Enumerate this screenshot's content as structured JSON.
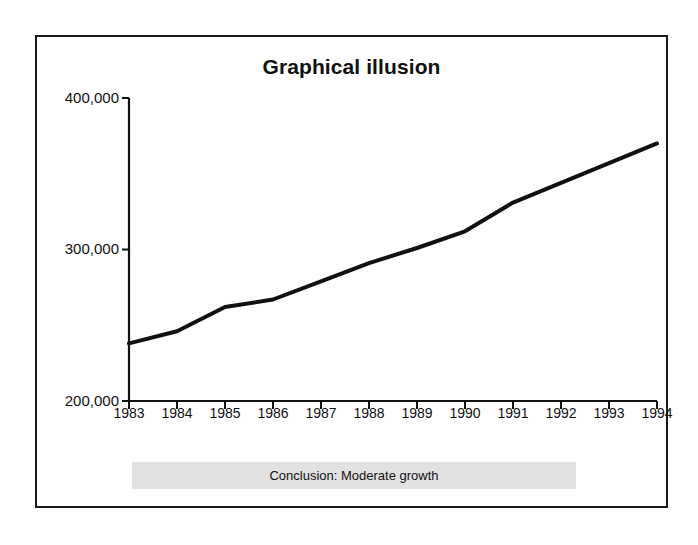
{
  "figure": {
    "title": "Graphical illusion",
    "conclusion_label": "Conclusion: Moderate growth",
    "frame_color": "#1a1a1a",
    "banner_color": "#e2e2e2",
    "line_color": "#111111",
    "background_color": "#ffffff"
  },
  "chart_data": {
    "type": "line",
    "title": "Graphical illusion",
    "subtitle": "",
    "xlabel": "",
    "ylabel": "",
    "x": [
      1983,
      1984,
      1985,
      1986,
      1987,
      1988,
      1989,
      1990,
      1991,
      1992,
      1993,
      1994
    ],
    "categories": [
      "1983",
      "1984",
      "1985",
      "1986",
      "1987",
      "1988",
      "1989",
      "1990",
      "1991",
      "1992",
      "1993",
      "1994"
    ],
    "values": [
      238000,
      246000,
      262000,
      267000,
      279000,
      291000,
      301000,
      312000,
      331000,
      344000,
      357000,
      370000
    ],
    "series": [
      {
        "name": "value",
        "values": [
          238000,
          246000,
          262000,
          267000,
          279000,
          291000,
          301000,
          312000,
          331000,
          344000,
          357000,
          370000
        ]
      }
    ],
    "ylim": [
      200000,
      400000
    ],
    "xlim": [
      1983,
      1994
    ],
    "ytick_values": [
      200000,
      300000,
      400000
    ],
    "ytick_labels": [
      "200,000",
      "300,000",
      "400,000"
    ],
    "xtick_labels": [
      "1983",
      "1984",
      "1985",
      "1986",
      "1987",
      "1988",
      "1989",
      "1990",
      "1991",
      "1992",
      "1993",
      "1994"
    ],
    "grid": false,
    "legend": false,
    "legend_position": "none",
    "annotations": [
      "Conclusion: Moderate growth"
    ],
    "note": "Y axis truncated at 200,000 rather than zero, exaggerating the apparent slope."
  },
  "axes": {
    "y_labels": [
      {
        "text": "400,000",
        "value": 400000
      },
      {
        "text": "300,000",
        "value": 300000
      },
      {
        "text": "200,000",
        "value": 200000
      }
    ],
    "x_labels": [
      {
        "text": "1983"
      },
      {
        "text": "1984"
      },
      {
        "text": "1985"
      },
      {
        "text": "1986"
      },
      {
        "text": "1987"
      },
      {
        "text": "1988"
      },
      {
        "text": "1989"
      },
      {
        "text": "1990"
      },
      {
        "text": "1991"
      },
      {
        "text": "1992"
      },
      {
        "text": "1993"
      },
      {
        "text": "1994"
      }
    ]
  }
}
